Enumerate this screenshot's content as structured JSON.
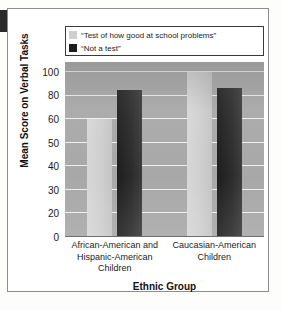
{
  "chart_data": {
    "type": "bar",
    "title": "",
    "subtitle": "",
    "xlabel": "Ethnic Group",
    "ylabel": "Mean Score on Verbal Tasks",
    "categories": [
      "African-American and Hispanic-American Children",
      "Caucasian-American Children"
    ],
    "series": [
      {
        "name": "“Test of how good at school problems”",
        "color": "#cfcfcf",
        "values": [
          60,
          100
        ]
      },
      {
        "name": "“Not a test”",
        "color": "#1d1d1d",
        "values": [
          85,
          86
        ]
      }
    ],
    "ylim": [
      0,
      105
    ],
    "yticks": [
      0,
      20,
      30,
      40,
      50,
      60,
      80,
      100
    ],
    "ytick_labels": [
      "0",
      "20",
      "30",
      "40",
      "50",
      "60",
      "80",
      "100"
    ],
    "grid": true,
    "legend_position": "top-inside"
  },
  "legend": {
    "entries": [
      {
        "label": "“Test of how good at school problems”",
        "color": "#cfcfcf"
      },
      {
        "label": "“Not a test”",
        "color": "#1d1d1d"
      }
    ]
  },
  "axes": {
    "y_title": "Mean Score on Verbal Tasks",
    "x_title": "Ethnic Group",
    "y_ticks": [
      "100",
      "80",
      "60",
      "50",
      "40",
      "30",
      "20",
      "0"
    ],
    "x_categories": [
      {
        "line1": "African-American and",
        "line2": "Hispanic-American",
        "line3": "Children"
      },
      {
        "line1": "Caucasian-American",
        "line2": "Children",
        "line3": ""
      }
    ]
  },
  "colors": {
    "plot_background": "#a8a8a8",
    "gridline": "#efefef",
    "frame_border": "#8d8d8d",
    "legend_border": "#3a3a3a",
    "series_light": "#cfcfcf",
    "series_dark": "#1d1d1d",
    "text": "#1b1b1b"
  }
}
